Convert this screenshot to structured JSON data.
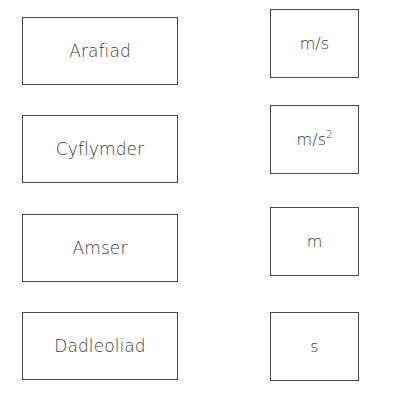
{
  "quantities": [
    {
      "label": "Arafiad"
    },
    {
      "label": "Cyflymder"
    },
    {
      "label": "Amser"
    },
    {
      "label": "Dadleoliad"
    }
  ],
  "units": [
    {
      "base": "m/s",
      "superscript": ""
    },
    {
      "base": "m/s",
      "superscript": "2"
    },
    {
      "base": "m",
      "superscript": ""
    },
    {
      "base": "s",
      "superscript": ""
    }
  ]
}
